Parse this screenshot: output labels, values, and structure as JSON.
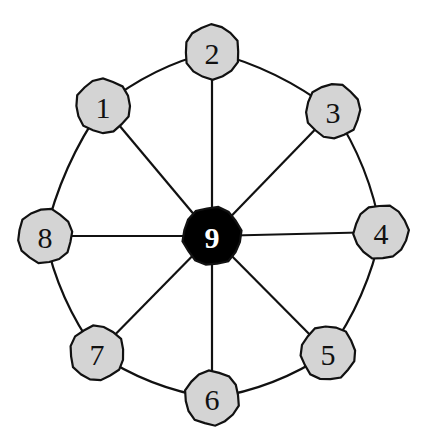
{
  "diagram": {
    "type": "wheel-graph",
    "colors": {
      "outer_node_fill": "#d4d4d4",
      "hub_node_fill": "#000000",
      "outer_label": "#111111",
      "hub_label": "#ffffff",
      "edge": "#111111",
      "background": "#ffffff"
    },
    "nodes": [
      {
        "id": "1",
        "label": "1",
        "x": 103,
        "y": 106,
        "r": 27,
        "hub": false
      },
      {
        "id": "2",
        "label": "2",
        "x": 212,
        "y": 52,
        "r": 27,
        "hub": false
      },
      {
        "id": "3",
        "label": "3",
        "x": 333,
        "y": 111,
        "r": 27,
        "hub": false
      },
      {
        "id": "4",
        "label": "4",
        "x": 381,
        "y": 232,
        "r": 27,
        "hub": false
      },
      {
        "id": "5",
        "label": "5",
        "x": 328,
        "y": 353,
        "r": 27,
        "hub": false
      },
      {
        "id": "6",
        "label": "6",
        "x": 212,
        "y": 398,
        "r": 27,
        "hub": false
      },
      {
        "id": "7",
        "label": "7",
        "x": 97,
        "y": 353,
        "r": 27,
        "hub": false
      },
      {
        "id": "8",
        "label": "8",
        "x": 45,
        "y": 236,
        "r": 27,
        "hub": false
      },
      {
        "id": "9",
        "label": "9",
        "x": 212,
        "y": 236,
        "r": 29,
        "hub": true
      }
    ],
    "spokes": [
      [
        "9",
        "1"
      ],
      [
        "9",
        "2"
      ],
      [
        "9",
        "3"
      ],
      [
        "9",
        "4"
      ],
      [
        "9",
        "5"
      ],
      [
        "9",
        "6"
      ],
      [
        "9",
        "7"
      ],
      [
        "9",
        "8"
      ]
    ],
    "rim": [
      [
        "1",
        "2"
      ],
      [
        "2",
        "3"
      ],
      [
        "3",
        "4"
      ],
      [
        "4",
        "5"
      ],
      [
        "5",
        "6"
      ],
      [
        "6",
        "7"
      ],
      [
        "7",
        "8"
      ],
      [
        "8",
        "1"
      ]
    ]
  }
}
